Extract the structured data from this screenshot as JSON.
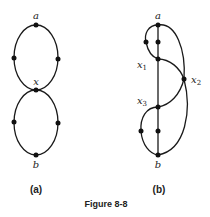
{
  "figure": {
    "caption": "Figure 8-8",
    "panels": [
      {
        "id": "a",
        "label": "(a)",
        "vertices": {
          "a": "a",
          "x": "x",
          "b": "b"
        }
      },
      {
        "id": "b",
        "label": "(b)",
        "vertices": {
          "a": "a",
          "x1": "x",
          "x1_sub": "1",
          "x2": "x",
          "x2_sub": "2",
          "x3": "x",
          "x3_sub": "3",
          "b": "b"
        }
      }
    ]
  }
}
